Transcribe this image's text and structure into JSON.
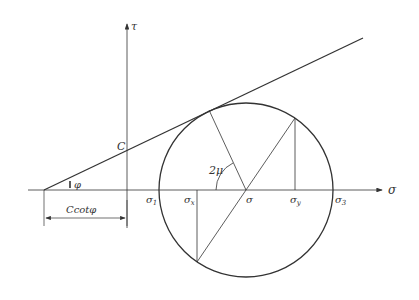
{
  "diagram": {
    "axes": {
      "horizontal_label": "σ",
      "vertical_label": "τ"
    },
    "labels": {
      "cohesion": "C",
      "friction_angle": "φ",
      "intercept_dimension": "Ccotφ",
      "angle": "2μ",
      "sigma1": "σ",
      "sigma1_sub": "1",
      "sigma3": "σ",
      "sigma3_sub": "3",
      "sigma_x": "σ",
      "sigma_x_sub": "x",
      "sigma_y": "σ",
      "sigma_y_sub": "y",
      "sigma_center": "σ"
    },
    "colors": {
      "stroke": "#333333",
      "background": "#ffffff"
    }
  }
}
